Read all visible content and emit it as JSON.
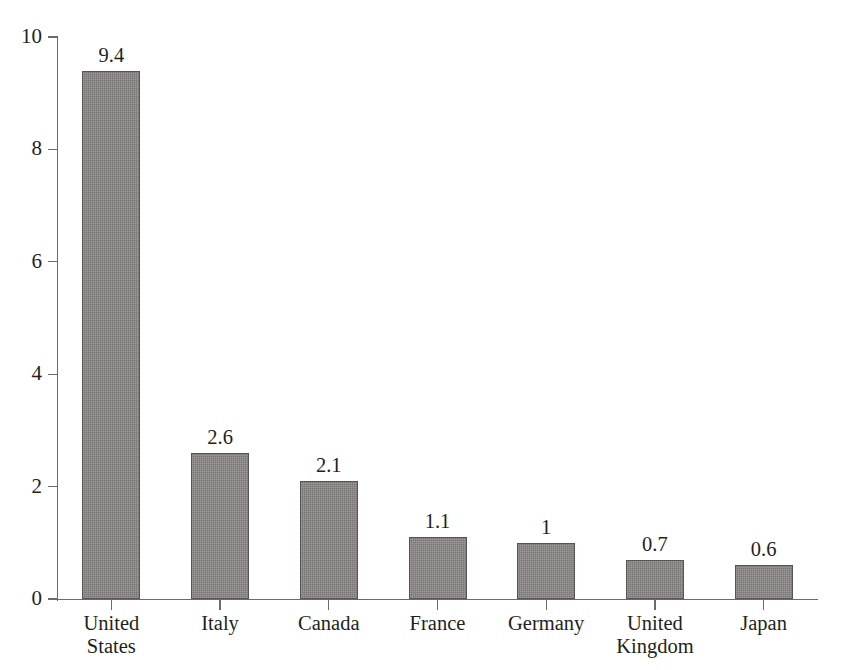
{
  "chart_data": {
    "type": "bar",
    "title": "",
    "subtitle": "",
    "xlabel": "",
    "ylabel": "",
    "categories": [
      "United States",
      "Italy",
      "Canada",
      "France",
      "Germany",
      "United Kingdom",
      "Japan"
    ],
    "values": [
      9.4,
      2.6,
      2.1,
      1.1,
      1,
      0.7,
      0.6
    ],
    "value_labels": [
      "9.4",
      "2.6",
      "2.1",
      "1.1",
      "1",
      "0.7",
      "0.6"
    ],
    "ylim": [
      0,
      10
    ],
    "yticks": [
      0,
      2,
      4,
      6,
      8,
      10
    ],
    "ytick_labels": [
      "0",
      "2",
      "4",
      "6",
      "8",
      "10"
    ],
    "grid": false,
    "legend": null,
    "legend_position": "none",
    "bar_fill_color": "#858281",
    "bar_border_color": "#575453",
    "axis_color": "#6e6a68",
    "text_color": "#231f20",
    "data_labels_shown": true
  },
  "axes": {
    "y_axis_name": "y-axis",
    "x_axis_name": "x-axis"
  }
}
